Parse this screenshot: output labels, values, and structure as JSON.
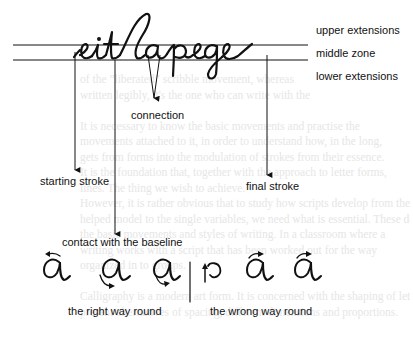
{
  "figure": {
    "cursive_sample": "eitlapege",
    "zone_labels": {
      "upper": "upper extensions",
      "middle": "middle zone",
      "lower": "lower extensions"
    },
    "annotations": {
      "connection": "connection",
      "starting_stroke": "starting stroke",
      "final_stroke": "final stroke",
      "contact_baseline": "contact with the baseline"
    },
    "direction_examples": {
      "right_label": "the right way round",
      "wrong_label": "the wrong way round",
      "right_glyphs": [
        "a",
        "a",
        "g"
      ],
      "wrong_glyphs": [
        "o",
        "a",
        "a"
      ]
    }
  },
  "background_text": [
    "of the ”liberated” scribble movement, whereas",
    "written legibly, it's the one who can write with the",
    "",
    "It is necessary to know the basic movements and practise the",
    "movements attached to it, in order to understand how, in the long,",
    "gets from forms into the modulation of strokes from their essence.",
    "It is the foundation that, together with the approach to letter forms,",
    "lines. The thing we wish to achieve.",
    "However, it is rather obvious that to study how scripts develop from the",
    "helped model to the single variables, we need what is essential. These do not",
    "the basic movements and styles of writing. In a classroom where a",
    "writing works with a script that has been worked out for the way",
    "organized in to groups.",
    "",
    "Calligraphy is a modern art form. It is concerned with the shaping of letters,",
    "present alternatives of spacing, different dimensions and proportions."
  ],
  "colors": {
    "ink": "#111111",
    "ghost_text": "#e6e6e6"
  }
}
